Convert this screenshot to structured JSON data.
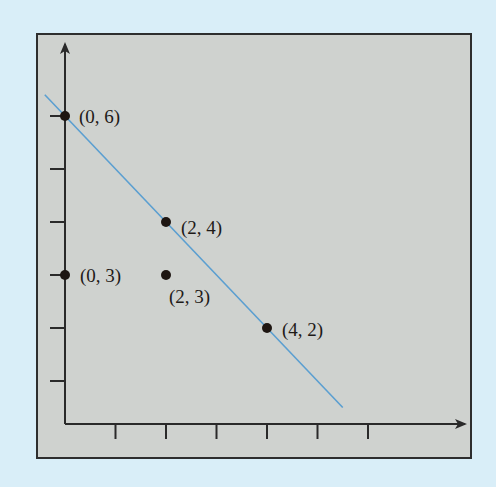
{
  "chart_data": {
    "type": "scatter",
    "title": "",
    "xlabel": "",
    "ylabel": "",
    "x_ticks": [
      1,
      2,
      3,
      4,
      5,
      6
    ],
    "y_ticks": [
      1,
      2,
      3,
      4,
      5,
      6
    ],
    "tick_labels_shown": false,
    "grid": false,
    "legend": null,
    "points": [
      {
        "x": 0,
        "y": 6,
        "label": "(0, 6)"
      },
      {
        "x": 2,
        "y": 4,
        "label": "(2, 4)"
      },
      {
        "x": 0,
        "y": 3,
        "label": "(0, 3)"
      },
      {
        "x": 2,
        "y": 3,
        "label": "(2, 3)"
      },
      {
        "x": 4,
        "y": 2,
        "label": "(4, 2)"
      }
    ],
    "lines": [
      {
        "name": "line through (0,6), (2,4), (4,2)",
        "slope": -1,
        "intercept": 6,
        "x_range": [
          -0.4,
          5.5
        ],
        "color": "#5b9fd1"
      }
    ],
    "colors": {
      "page_background": "#d9eef8",
      "plot_background": "#cfd2cf",
      "axis": "#2a2a2a",
      "points": "#1e1612",
      "line": "#5b9fd1"
    }
  }
}
